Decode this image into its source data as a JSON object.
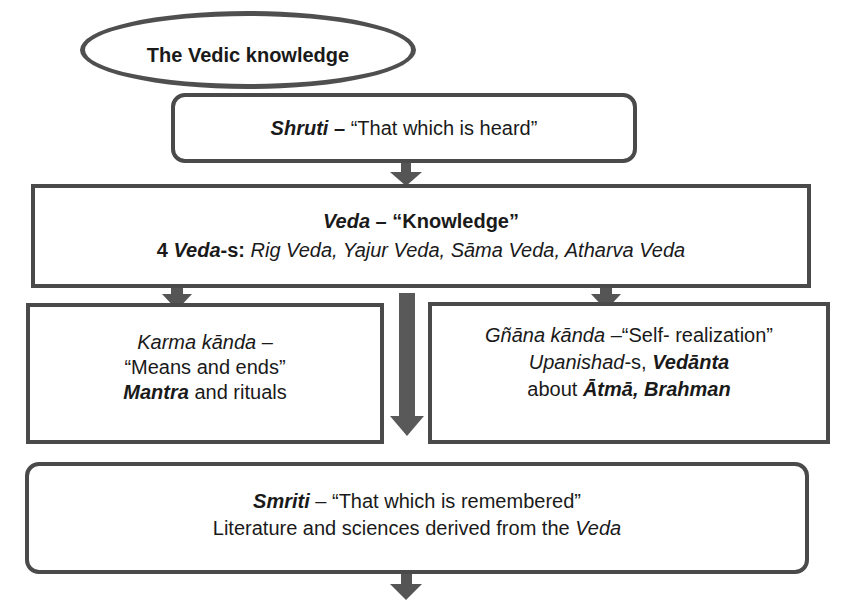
{
  "diagram": {
    "type": "flowchart",
    "root": {
      "label": "The Vedic knowledge"
    },
    "shruti": {
      "term": "Shruti",
      "sep": " – ",
      "meaning": "“That which is heard”"
    },
    "veda": {
      "term": "Veda",
      "sep": " – ",
      "meaning": "“Knowledge”",
      "count_prefix": "4 ",
      "count_term": "Veda",
      "count_suffix": "-s: ",
      "list": "Rig Veda, Yajur Veda, Sāma Veda, Atharva Veda"
    },
    "karma": {
      "term": "Karma kānda –",
      "meaning": "“Means and ends”",
      "detail_bold": "Mantra",
      "detail_rest": " and rituals"
    },
    "gnana": {
      "term": "Gñāna kānda",
      "sep": " –",
      "meaning": "“Self- realization”",
      "line2_italic": "Upanishad",
      "line2_suffix": "-s, ",
      "line2_bold": "Vedānta",
      "line3_prefix": "about ",
      "line3_bold": "Ātmā, Brahman"
    },
    "smriti": {
      "term": "Smriti",
      "sep": " – ",
      "meaning": "“That which is remembered”",
      "line2_prefix": "Literature and sciences derived from the ",
      "line2_italic": "Veda"
    },
    "arrows": [
      {
        "from": "shruti",
        "to": "veda"
      },
      {
        "from": "veda",
        "to": "karma"
      },
      {
        "from": "veda",
        "to": "gnana"
      },
      {
        "from": "veda",
        "to": "smriti"
      },
      {
        "from": "smriti",
        "to": "continuation"
      }
    ],
    "colors": {
      "border": "#4a4a4a",
      "arrow": "#555555",
      "text": "#1a1a1a",
      "background": "#ffffff"
    }
  }
}
